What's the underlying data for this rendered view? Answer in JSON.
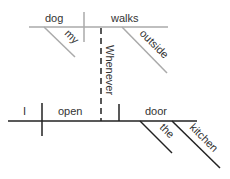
{
  "diagram": {
    "type": "sentence-diagram",
    "sentence": "Whenever I open the kitchen door my dog walks outside",
    "main_clause": {
      "subject": "dog",
      "verb": "walks",
      "modifiers": {
        "subject": [
          "my"
        ],
        "verb": [
          "outside"
        ]
      }
    },
    "connector": "Whenever",
    "subordinate_clause": {
      "subject": "I",
      "verb": "open",
      "object": "door",
      "modifiers": {
        "object": [
          "the",
          "kitchen"
        ]
      }
    },
    "colors": {
      "top_line": "#aaaaaa",
      "bottom_line": "#222222",
      "text": "#333333"
    }
  }
}
